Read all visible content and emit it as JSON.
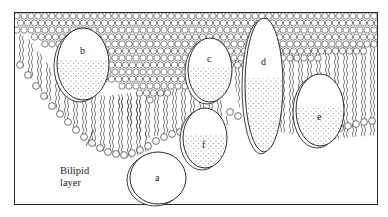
{
  "diagram": {
    "caption": {
      "line1": "Bilipid",
      "line2": "layer"
    },
    "proteins": [
      {
        "id": "a",
        "label": "a",
        "cx": 158,
        "cy": 178,
        "rx": 28,
        "ry": 26
      },
      {
        "id": "b",
        "label": "b",
        "cx": 83,
        "cy": 64,
        "rx": 26,
        "ry": 36
      },
      {
        "id": "c",
        "label": "c",
        "cx": 210,
        "cy": 70,
        "rx": 22,
        "ry": 32
      },
      {
        "id": "d",
        "label": "d",
        "cx": 264,
        "cy": 85,
        "rx": 19,
        "ry": 67
      },
      {
        "id": "e",
        "label": "e",
        "cx": 320,
        "cy": 110,
        "rx": 24,
        "ry": 36
      },
      {
        "id": "f",
        "label": "f",
        "cx": 205,
        "cy": 138,
        "rx": 22,
        "ry": 30
      }
    ],
    "colors": {
      "ink": "#2a2a2a",
      "background": "#ffffff",
      "stipple": "#555555"
    }
  }
}
